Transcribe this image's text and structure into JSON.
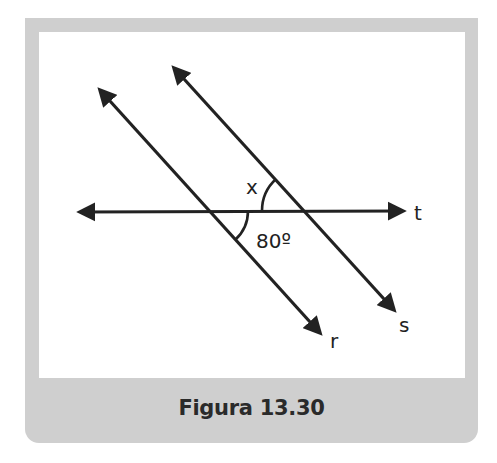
{
  "figure": {
    "caption": "Figura 13.30",
    "line_labels": {
      "r": "r",
      "s": "s",
      "t": "t"
    },
    "angle_labels": {
      "x": "x",
      "known": "80º"
    },
    "known_angle_degrees": 80
  },
  "colors": {
    "frame": "#cfcfcf",
    "panel": "#ffffff",
    "ink": "#222222"
  }
}
